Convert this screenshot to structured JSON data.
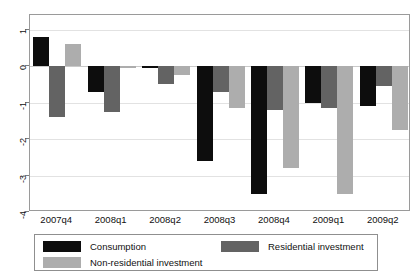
{
  "chart_data": {
    "type": "bar",
    "title": "",
    "subtitle": "",
    "xlabel": "",
    "ylabel": "",
    "categories": [
      "2007q4",
      "2008q1",
      "2008q2",
      "2008q3",
      "2008q4",
      "2009q1",
      "2009q2"
    ],
    "series": [
      {
        "name": "Consumption",
        "color": "#0d0d0d",
        "values": [
          0.8,
          -0.7,
          -0.05,
          -2.6,
          -3.5,
          -1.0,
          -1.1
        ]
      },
      {
        "name": "Residential investment",
        "color": "#636363",
        "values": [
          -1.4,
          -1.25,
          -0.5,
          -0.7,
          -1.2,
          -1.15,
          -0.55
        ]
      },
      {
        "name": "Non-residential investment",
        "color": "#adadad",
        "values": [
          0.6,
          -0.05,
          -0.25,
          -1.15,
          -2.8,
          -3.5,
          -1.75
        ]
      }
    ],
    "ylim": [
      -4,
      1.4
    ],
    "yticks": [
      1,
      0,
      -1,
      -2,
      -3,
      -4
    ],
    "ytick_labels": [
      "1",
      "0",
      "-1",
      "-2",
      "-3",
      "-4"
    ],
    "grid": true,
    "legend_position": "below-axes",
    "legend_entries": [
      "Consumption",
      "Residential investment",
      "Non-residential investment"
    ]
  }
}
